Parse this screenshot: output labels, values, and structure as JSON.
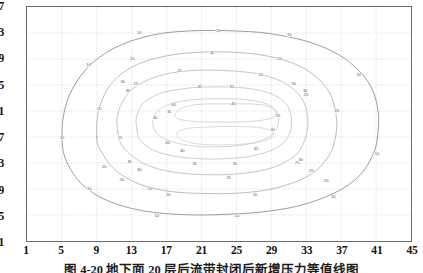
{
  "figure": {
    "caption": "图 4-20  地下面 20 层后流带封闭后新增压力等值线图",
    "frame_color": "#6b6b6b",
    "grid_color": "#c9c9c9",
    "background": "#ffffff"
  },
  "chart_data": {
    "type": "line",
    "subtype": "contour",
    "title": "",
    "xlabel": "",
    "ylabel": "",
    "xlim": [
      1,
      45
    ],
    "ylim": [
      1,
      37
    ],
    "grid": true,
    "legend": "none",
    "xticks": [
      1,
      5,
      9,
      13,
      17,
      21,
      25,
      29,
      33,
      37,
      41,
      45
    ],
    "yticks": [
      1,
      5,
      9,
      13,
      17,
      21,
      25,
      29,
      33,
      37
    ],
    "contour_levels": [
      10,
      20,
      25,
      30,
      35,
      40,
      45
    ],
    "level_colors": {
      "10": "#8a8a94",
      "20": "#9aa0a8",
      "25": "#a8aeb4",
      "30": "#b2b8bc",
      "35": "#bcc2c4",
      "40": "#c2c8c8",
      "45": "#c8cccc"
    },
    "series": [
      {
        "name": "contour-10",
        "level": 10,
        "closed": true,
        "points": [
          [
            5.0,
            17.0
          ],
          [
            5.1,
            19.6
          ],
          [
            5.5,
            22.1
          ],
          [
            6.2,
            24.4
          ],
          [
            7.2,
            26.5
          ],
          [
            8.5,
            28.4
          ],
          [
            10.1,
            30.0
          ],
          [
            12.0,
            31.3
          ],
          [
            14.2,
            32.3
          ],
          [
            16.7,
            33.0
          ],
          [
            19.4,
            33.3
          ],
          [
            22.2,
            33.4
          ],
          [
            25.0,
            33.3
          ],
          [
            27.7,
            33.1
          ],
          [
            30.2,
            32.6
          ],
          [
            32.6,
            31.9
          ],
          [
            34.8,
            30.9
          ],
          [
            36.8,
            29.6
          ],
          [
            38.4,
            28.0
          ],
          [
            39.7,
            26.2
          ],
          [
            40.6,
            24.2
          ],
          [
            41.1,
            22.0
          ],
          [
            41.3,
            19.7
          ],
          [
            41.2,
            17.4
          ],
          [
            40.9,
            15.2
          ],
          [
            40.2,
            13.1
          ],
          [
            39.2,
            11.2
          ],
          [
            37.8,
            9.6
          ],
          [
            36.1,
            8.3
          ],
          [
            34.1,
            7.2
          ],
          [
            31.8,
            6.3
          ],
          [
            29.3,
            5.7
          ],
          [
            26.6,
            5.3
          ],
          [
            23.8,
            5.1
          ],
          [
            21.0,
            5.0
          ],
          [
            18.2,
            5.1
          ],
          [
            15.5,
            5.4
          ],
          [
            13.0,
            6.0
          ],
          [
            10.8,
            6.9
          ],
          [
            8.9,
            8.1
          ],
          [
            7.4,
            9.6
          ],
          [
            6.3,
            11.4
          ],
          [
            5.5,
            13.3
          ],
          [
            5.1,
            15.2
          ],
          [
            5.0,
            17.0
          ]
        ]
      },
      {
        "name": "contour-20",
        "level": 20,
        "closed": true,
        "points": [
          [
            9.0,
            17.0
          ],
          [
            9.0,
            19.3
          ],
          [
            9.3,
            21.5
          ],
          [
            9.9,
            23.6
          ],
          [
            10.8,
            25.4
          ],
          [
            12.1,
            27.0
          ],
          [
            13.7,
            28.2
          ],
          [
            15.7,
            29.1
          ],
          [
            17.9,
            29.7
          ],
          [
            20.3,
            30.0
          ],
          [
            22.8,
            30.1
          ],
          [
            25.2,
            30.0
          ],
          [
            27.5,
            29.7
          ],
          [
            29.7,
            29.1
          ],
          [
            31.6,
            28.3
          ],
          [
            33.2,
            27.2
          ],
          [
            34.5,
            25.8
          ],
          [
            35.5,
            24.2
          ],
          [
            36.1,
            22.4
          ],
          [
            36.4,
            20.5
          ],
          [
            36.5,
            18.6
          ],
          [
            36.3,
            16.7
          ],
          [
            35.9,
            14.9
          ],
          [
            35.1,
            13.2
          ],
          [
            34.0,
            11.7
          ],
          [
            32.5,
            10.5
          ],
          [
            30.7,
            9.6
          ],
          [
            28.7,
            8.9
          ],
          [
            26.5,
            8.5
          ],
          [
            24.1,
            8.3
          ],
          [
            21.7,
            8.3
          ],
          [
            19.3,
            8.4
          ],
          [
            17.0,
            8.7
          ],
          [
            14.9,
            9.3
          ],
          [
            13.1,
            10.2
          ],
          [
            11.6,
            11.4
          ],
          [
            10.4,
            12.9
          ],
          [
            9.6,
            14.6
          ],
          [
            9.1,
            15.8
          ],
          [
            9.0,
            17.0
          ]
        ]
      },
      {
        "name": "contour-25",
        "level": 25,
        "closed": true,
        "points": [
          [
            11.4,
            17.8
          ],
          [
            11.3,
            19.6
          ],
          [
            11.6,
            21.4
          ],
          [
            12.2,
            23.0
          ],
          [
            13.1,
            24.4
          ],
          [
            14.4,
            25.5
          ],
          [
            15.9,
            26.3
          ],
          [
            17.7,
            26.9
          ],
          [
            19.7,
            27.2
          ],
          [
            21.8,
            27.3
          ],
          [
            23.9,
            27.2
          ],
          [
            26.0,
            27.0
          ],
          [
            27.9,
            26.6
          ],
          [
            29.6,
            25.9
          ],
          [
            31.0,
            24.9
          ],
          [
            32.1,
            23.6
          ],
          [
            32.8,
            22.1
          ],
          [
            33.1,
            20.5
          ],
          [
            33.2,
            18.9
          ],
          [
            33.0,
            17.3
          ],
          [
            32.6,
            15.8
          ],
          [
            31.9,
            14.4
          ],
          [
            30.8,
            13.3
          ],
          [
            29.4,
            12.4
          ],
          [
            27.7,
            11.8
          ],
          [
            25.8,
            11.4
          ],
          [
            23.8,
            11.2
          ],
          [
            21.7,
            11.2
          ],
          [
            19.7,
            11.3
          ],
          [
            17.8,
            11.6
          ],
          [
            16.0,
            12.1
          ],
          [
            14.4,
            12.9
          ],
          [
            13.1,
            14.0
          ],
          [
            12.1,
            15.3
          ],
          [
            11.6,
            16.5
          ],
          [
            11.4,
            17.8
          ]
        ]
      },
      {
        "name": "contour-30",
        "level": 30,
        "closed": true,
        "points": [
          [
            13.6,
            18.2
          ],
          [
            13.5,
            19.7
          ],
          [
            13.8,
            21.1
          ],
          [
            14.4,
            22.3
          ],
          [
            15.4,
            23.2
          ],
          [
            16.7,
            23.9
          ],
          [
            18.3,
            24.3
          ],
          [
            20.0,
            24.6
          ],
          [
            21.9,
            24.7
          ],
          [
            23.7,
            24.7
          ],
          [
            25.5,
            24.6
          ],
          [
            27.2,
            24.3
          ],
          [
            28.7,
            23.8
          ],
          [
            29.9,
            23.0
          ],
          [
            30.8,
            21.9
          ],
          [
            31.2,
            20.6
          ],
          [
            31.3,
            19.3
          ],
          [
            31.2,
            18.0
          ],
          [
            30.8,
            16.8
          ],
          [
            30.0,
            15.7
          ],
          [
            28.9,
            14.9
          ],
          [
            27.5,
            14.3
          ],
          [
            25.9,
            13.9
          ],
          [
            24.1,
            13.7
          ],
          [
            22.2,
            13.6
          ],
          [
            20.4,
            13.7
          ],
          [
            18.6,
            13.9
          ],
          [
            17.0,
            14.3
          ],
          [
            15.6,
            14.9
          ],
          [
            14.5,
            15.8
          ],
          [
            13.8,
            16.9
          ],
          [
            13.6,
            18.2
          ]
        ]
      },
      {
        "name": "contour-35",
        "level": 35,
        "closed": true,
        "points": [
          [
            15.5,
            18.4
          ],
          [
            15.4,
            19.6
          ],
          [
            15.8,
            20.7
          ],
          [
            16.6,
            21.6
          ],
          [
            17.7,
            22.2
          ],
          [
            19.1,
            22.6
          ],
          [
            20.7,
            22.8
          ],
          [
            22.4,
            22.9
          ],
          [
            24.1,
            22.9
          ],
          [
            25.8,
            22.8
          ],
          [
            27.3,
            22.5
          ],
          [
            28.6,
            22.0
          ],
          [
            29.4,
            21.2
          ],
          [
            29.8,
            20.2
          ],
          [
            29.8,
            19.1
          ],
          [
            29.5,
            18.0
          ],
          [
            28.8,
            17.1
          ],
          [
            27.7,
            16.4
          ],
          [
            26.3,
            15.9
          ],
          [
            24.7,
            15.6
          ],
          [
            23.0,
            15.5
          ],
          [
            21.3,
            15.5
          ],
          [
            19.6,
            15.7
          ],
          [
            18.1,
            16.1
          ],
          [
            16.8,
            16.7
          ],
          [
            15.9,
            17.5
          ],
          [
            15.5,
            18.4
          ]
        ]
      },
      {
        "name": "contour-40-upper",
        "level": 40,
        "closed": true,
        "points": [
          [
            17.9,
            20.3
          ],
          [
            18.4,
            21.2
          ],
          [
            19.3,
            21.7
          ],
          [
            20.5,
            22.0
          ],
          [
            21.9,
            22.1
          ],
          [
            23.4,
            22.1
          ],
          [
            24.9,
            22.1
          ],
          [
            26.3,
            22.1
          ],
          [
            27.6,
            22.0
          ],
          [
            28.7,
            21.7
          ],
          [
            29.4,
            21.1
          ],
          [
            29.5,
            20.4
          ],
          [
            29.0,
            19.9
          ],
          [
            28.0,
            19.6
          ],
          [
            26.6,
            19.4
          ],
          [
            25.0,
            19.3
          ],
          [
            23.3,
            19.3
          ],
          [
            21.6,
            19.3
          ],
          [
            20.1,
            19.4
          ],
          [
            18.9,
            19.6
          ],
          [
            18.1,
            19.9
          ],
          [
            17.9,
            20.3
          ]
        ]
      },
      {
        "name": "contour-45-lower",
        "level": 45,
        "closed": true,
        "points": [
          [
            18.2,
            17.6
          ],
          [
            18.8,
            18.1
          ],
          [
            19.9,
            18.4
          ],
          [
            21.3,
            18.5
          ],
          [
            22.8,
            18.6
          ],
          [
            24.4,
            18.6
          ],
          [
            25.9,
            18.6
          ],
          [
            27.3,
            18.5
          ],
          [
            28.5,
            18.2
          ],
          [
            29.2,
            17.7
          ],
          [
            29.1,
            17.0
          ],
          [
            28.4,
            16.5
          ],
          [
            27.2,
            16.1
          ],
          [
            25.7,
            15.9
          ],
          [
            24.0,
            15.8
          ],
          [
            22.3,
            15.8
          ],
          [
            20.8,
            15.9
          ],
          [
            19.5,
            16.2
          ],
          [
            18.6,
            16.6
          ],
          [
            18.2,
            17.1
          ],
          [
            18.2,
            17.6
          ]
        ]
      }
    ],
    "inline_labels": [
      {
        "text": "10",
        "x": 13.8,
        "y": 33.1
      },
      {
        "text": "10",
        "x": 22.8,
        "y": 33.4
      },
      {
        "text": "10",
        "x": 30.9,
        "y": 32.7
      },
      {
        "text": "10",
        "x": 8.0,
        "y": 28.2
      },
      {
        "text": "10",
        "x": 38.8,
        "y": 26.6
      },
      {
        "text": "10",
        "x": 5.0,
        "y": 17.0
      },
      {
        "text": "10",
        "x": 40.9,
        "y": 14.6
      },
      {
        "text": "10",
        "x": 8.1,
        "y": 9.3
      },
      {
        "text": "10",
        "x": 35.9,
        "y": 8.0
      },
      {
        "text": "10",
        "x": 15.8,
        "y": 5.1
      },
      {
        "text": "10",
        "x": 24.9,
        "y": 5.1
      },
      {
        "text": "20",
        "x": 13.0,
        "y": 29.0
      },
      {
        "text": "20",
        "x": 29.8,
        "y": 29.1
      },
      {
        "text": "20",
        "x": 9.2,
        "y": 21.4
      },
      {
        "text": "20",
        "x": 36.3,
        "y": 21.2
      },
      {
        "text": "20",
        "x": 9.8,
        "y": 12.6
      },
      {
        "text": "20",
        "x": 11.8,
        "y": 10.6
      },
      {
        "text": "20",
        "x": 15.0,
        "y": 9.2
      },
      {
        "text": "20",
        "x": 17.1,
        "y": 8.3
      },
      {
        "text": "20",
        "x": 27.0,
        "y": 8.4
      },
      {
        "text": "20",
        "x": 35.1,
        "y": 10.5
      },
      {
        "text": "25",
        "x": 18.4,
        "y": 27.2
      },
      {
        "text": "25",
        "x": 27.6,
        "y": 26.6
      },
      {
        "text": "25",
        "x": 13.4,
        "y": 25.2
      },
      {
        "text": "25",
        "x": 32.8,
        "y": 23.6
      },
      {
        "text": "25",
        "x": 11.6,
        "y": 17.0
      },
      {
        "text": "25",
        "x": 31.8,
        "y": 13.2
      },
      {
        "text": "25",
        "x": 33.4,
        "y": 12.0
      },
      {
        "text": "25",
        "x": 24.0,
        "y": 10.9
      },
      {
        "text": "30",
        "x": 22.1,
        "y": 30.0
      },
      {
        "text": "30",
        "x": 11.9,
        "y": 25.6
      },
      {
        "text": "30",
        "x": 12.5,
        "y": 24.2
      },
      {
        "text": "30",
        "x": 31.4,
        "y": 25.2
      },
      {
        "text": "30",
        "x": 32.7,
        "y": 24.2
      },
      {
        "text": "30",
        "x": 12.7,
        "y": 13.4
      },
      {
        "text": "30",
        "x": 13.8,
        "y": 12.2
      },
      {
        "text": "30",
        "x": 32.2,
        "y": 13.6
      },
      {
        "text": "35",
        "x": 20.7,
        "y": 24.8
      },
      {
        "text": "35",
        "x": 24.3,
        "y": 24.8
      },
      {
        "text": "35",
        "x": 17.2,
        "y": 21.0
      },
      {
        "text": "35",
        "x": 29.6,
        "y": 20.4
      },
      {
        "text": "35",
        "x": 20.1,
        "y": 13.0
      },
      {
        "text": "35",
        "x": 24.7,
        "y": 13.0
      },
      {
        "text": "40",
        "x": 17.7,
        "y": 22.0
      },
      {
        "text": "40",
        "x": 24.5,
        "y": 22.2
      },
      {
        "text": "40",
        "x": 15.6,
        "y": 20.0
      },
      {
        "text": "40",
        "x": 29.0,
        "y": 18.3
      },
      {
        "text": "40",
        "x": 17.0,
        "y": 16.2
      },
      {
        "text": "40",
        "x": 18.7,
        "y": 15.1
      },
      {
        "text": "45",
        "x": 27.1,
        "y": 15.4
      }
    ]
  },
  "axes": {
    "x_labels": [
      "1",
      "5",
      "9",
      "13",
      "17",
      "21",
      "25",
      "29",
      "33",
      "37",
      "41",
      "45"
    ],
    "y_labels": [
      "1",
      "5",
      "9",
      "13",
      "17",
      "21",
      "25",
      "29",
      "33",
      "37"
    ]
  }
}
